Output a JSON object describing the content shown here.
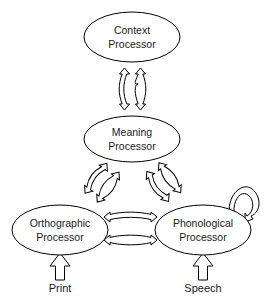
{
  "diagram": {
    "background_color": "#ffffff",
    "line_color": "#000000",
    "fill_color": "#ffffff",
    "text_color": "#1a1a1a",
    "nodes": [
      {
        "id": "context",
        "line1": "Context",
        "line2": "Processor",
        "cx": 132,
        "cy": 37,
        "rx": 48,
        "ry": 25
      },
      {
        "id": "meaning",
        "line1": "Meaning",
        "line2": "Processor",
        "cx": 132,
        "cy": 139,
        "rx": 48,
        "ry": 23
      },
      {
        "id": "orthographic",
        "line1": "Orthographic",
        "line2": "Processor",
        "cx": 60,
        "cy": 230,
        "rx": 48,
        "ry": 25
      },
      {
        "id": "phonological",
        "line1": "Phonological",
        "line2": "Processor",
        "cx": 203,
        "cy": 230,
        "rx": 48,
        "ry": 25
      }
    ],
    "connections": [
      {
        "id": "context-meaning",
        "from": "context",
        "to": "meaning",
        "kind": "double-arrow-pair",
        "orientation": "vertical"
      },
      {
        "id": "meaning-orthographic",
        "from": "meaning",
        "to": "orthographic",
        "kind": "double-arrow-pair",
        "orientation": "diagonal-left"
      },
      {
        "id": "meaning-phonological",
        "from": "meaning",
        "to": "phonological",
        "kind": "double-arrow-pair",
        "orientation": "diagonal-right"
      },
      {
        "id": "orthographic-phonological",
        "from": "orthographic",
        "to": "phonological",
        "kind": "double-arrow-pair",
        "orientation": "horizontal"
      },
      {
        "id": "phonological-self",
        "from": "phonological",
        "to": "phonological",
        "kind": "self-loop",
        "orientation": "top-right"
      }
    ],
    "inputs": [
      {
        "id": "print",
        "label": "Print",
        "target": "orthographic",
        "x": 60,
        "label_y": 292
      },
      {
        "id": "speech",
        "label": "Speech",
        "target": "phonological",
        "x": 203,
        "label_y": 292
      }
    ]
  }
}
